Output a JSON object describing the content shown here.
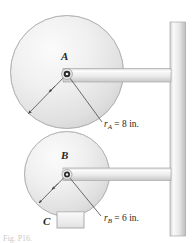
{
  "figure": {
    "type": "mechanics-pulley-diagram",
    "background_color": "#ffffff",
    "caption_partial": "Fig. P16.",
    "pulleys": [
      {
        "id": "A",
        "label": "A",
        "center": {
          "x": 67,
          "y": 72
        },
        "radius_px": 57,
        "radius_text": "r",
        "radius_subscript": "A",
        "radius_equals": " = 8 in.",
        "radius_value": 8,
        "radius_units": "in."
      },
      {
        "id": "B",
        "label": "B",
        "center": {
          "x": 67,
          "y": 174
        },
        "radius_px": 43,
        "radius_text": "r",
        "radius_subscript": "B",
        "radius_equals": " = 6 in.",
        "radius_value": 6,
        "radius_units": "in."
      }
    ],
    "block": {
      "id": "C",
      "label": "C"
    },
    "support": {
      "name": "vertical-wall-post"
    },
    "arms": [
      {
        "name": "arm-A",
        "from_pulley": "A"
      },
      {
        "name": "arm-B",
        "from_pulley": "B"
      }
    ],
    "colors": {
      "disk_light": "#f4f4f4",
      "disk_mid": "#e3e3e3",
      "disk_dark": "#cfcfcf",
      "outline": "#9a9a9a",
      "metal_light": "#f7f7f7",
      "metal_mid": "#e0e0e0",
      "metal_dark": "#c4c4c4",
      "hub": "#1c1c1c",
      "dimension_line": "#4a4a4a",
      "text": "#262626"
    }
  }
}
